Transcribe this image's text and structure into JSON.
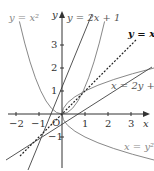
{
  "figure": {
    "axes": {
      "x_label": "x",
      "y_label": "y",
      "origin_label": "O",
      "x_ticks": [
        "−2",
        "−1",
        "1",
        "2",
        "3"
      ],
      "y_ticks": [
        "3",
        "2",
        "1",
        "−1"
      ]
    },
    "curves": [
      {
        "label": "y=x²",
        "type": "parabola",
        "color": "#777777"
      },
      {
        "label": "y=2x+1",
        "type": "line",
        "color": "#555555"
      },
      {
        "label": "y=x",
        "type": "dashed line",
        "color": "#222222"
      },
      {
        "label": "x=2y+1",
        "type": "line",
        "color": "#555555"
      },
      {
        "label": "x=y²",
        "type": "parabola",
        "color": "#777777"
      }
    ],
    "labels": {
      "y_eq_x2": "y = x²",
      "y_eq_2x1": "y = 2x + 1",
      "y_eq_x": "y = x",
      "x_eq_2y1": "x = 2y + 1",
      "x_eq_y2": "x = y²"
    }
  }
}
